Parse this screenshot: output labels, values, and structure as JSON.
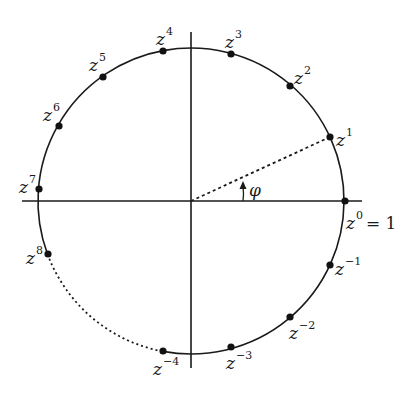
{
  "diagram": {
    "type": "unit-circle-roots-of-unity",
    "colors": {
      "stroke": "#1a1a1a",
      "background": "#ffffff",
      "point": "#111111"
    },
    "center": {
      "x": 191,
      "y": 201
    },
    "radius": 153,
    "axes": {
      "horizontal": {
        "x1": 22,
        "x2": 362,
        "y": 201
      },
      "vertical": {
        "x": 191,
        "y1": 32,
        "y2": 368
      }
    },
    "angle_label": "φ",
    "unit_label": "= 1",
    "dotted_arc": {
      "from": "z^8",
      "to": "z^-4"
    },
    "points": [
      {
        "name": "z0",
        "base": "z",
        "exp": "0",
        "x": 345,
        "y": 201,
        "lx": 346,
        "ly": 229
      },
      {
        "name": "z1",
        "base": "z",
        "exp": "1",
        "x": 330,
        "y": 137,
        "lx": 336,
        "ly": 146
      },
      {
        "name": "z2",
        "base": "z",
        "exp": "2",
        "x": 290,
        "y": 86,
        "lx": 294,
        "ly": 84
      },
      {
        "name": "z3",
        "base": "z",
        "exp": "3",
        "x": 231,
        "y": 54,
        "lx": 225,
        "ly": 48
      },
      {
        "name": "z4",
        "base": "z",
        "exp": "4",
        "x": 163,
        "y": 51,
        "lx": 156,
        "ly": 45
      },
      {
        "name": "z5",
        "base": "z",
        "exp": "5",
        "x": 103,
        "y": 77,
        "lx": 89,
        "ly": 71
      },
      {
        "name": "z6",
        "base": "z",
        "exp": "6",
        "x": 59,
        "y": 126,
        "lx": 43,
        "ly": 121
      },
      {
        "name": "z7",
        "base": "z",
        "exp": "7",
        "x": 39,
        "y": 189,
        "lx": 19,
        "ly": 193
      },
      {
        "name": "z8",
        "base": "z",
        "exp": "8",
        "x": 48,
        "y": 254,
        "lx": 26,
        "ly": 264
      },
      {
        "name": "zm4",
        "base": "z",
        "exp": "−4",
        "x": 163,
        "y": 351,
        "lx": 153,
        "ly": 375
      },
      {
        "name": "zm3",
        "base": "z",
        "exp": "−3",
        "x": 231,
        "y": 347,
        "lx": 226,
        "ly": 369
      },
      {
        "name": "zm2",
        "base": "z",
        "exp": "−2",
        "x": 290,
        "y": 317,
        "lx": 289,
        "ly": 339
      },
      {
        "name": "zm1",
        "base": "z",
        "exp": "−1",
        "x": 330,
        "y": 265,
        "lx": 335,
        "ly": 275
      }
    ]
  }
}
